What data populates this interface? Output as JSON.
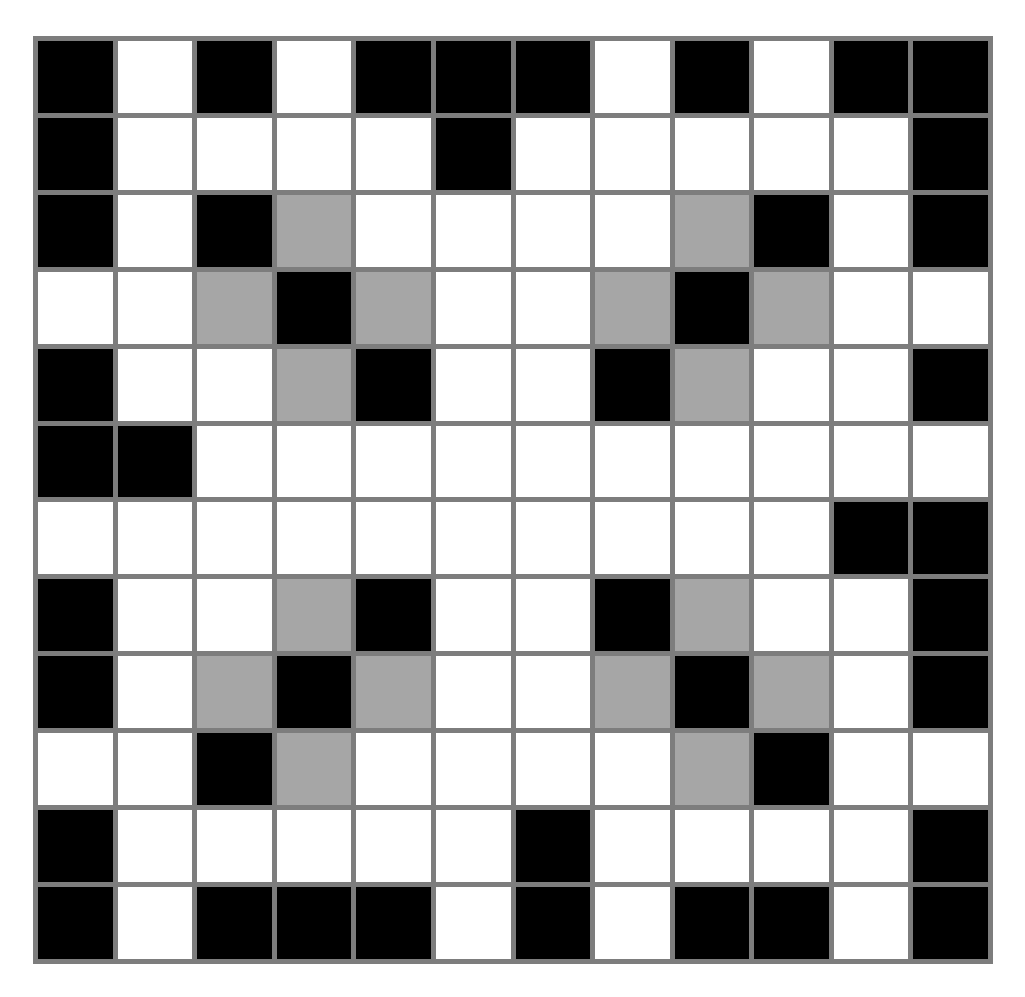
{
  "puzzle": {
    "rows": 12,
    "cols": 12,
    "legend": {
      "B": "black",
      "W": "white",
      "G": "gray"
    },
    "colors": {
      "black": "#000000",
      "white": "#ffffff",
      "gray": "#a6a6a6",
      "grid_line": "#7d7d7d"
    },
    "grid": [
      [
        "B",
        "W",
        "B",
        "W",
        "B",
        "B",
        "B",
        "W",
        "B",
        "W",
        "B",
        "B"
      ],
      [
        "B",
        "W",
        "W",
        "W",
        "W",
        "B",
        "W",
        "W",
        "W",
        "W",
        "W",
        "B"
      ],
      [
        "B",
        "W",
        "B",
        "G",
        "W",
        "W",
        "W",
        "W",
        "G",
        "B",
        "W",
        "B"
      ],
      [
        "W",
        "W",
        "G",
        "B",
        "G",
        "W",
        "W",
        "G",
        "B",
        "G",
        "W",
        "W"
      ],
      [
        "B",
        "W",
        "W",
        "G",
        "B",
        "W",
        "W",
        "B",
        "G",
        "W",
        "W",
        "B"
      ],
      [
        "B",
        "B",
        "W",
        "W",
        "W",
        "W",
        "W",
        "W",
        "W",
        "W",
        "W",
        "W"
      ],
      [
        "W",
        "W",
        "W",
        "W",
        "W",
        "W",
        "W",
        "W",
        "W",
        "W",
        "B",
        "B"
      ],
      [
        "B",
        "W",
        "W",
        "G",
        "B",
        "W",
        "W",
        "B",
        "G",
        "W",
        "W",
        "B"
      ],
      [
        "B",
        "W",
        "G",
        "B",
        "G",
        "W",
        "W",
        "G",
        "B",
        "G",
        "W",
        "B"
      ],
      [
        "W",
        "W",
        "B",
        "G",
        "W",
        "W",
        "W",
        "W",
        "G",
        "B",
        "W",
        "W"
      ],
      [
        "B",
        "W",
        "W",
        "W",
        "W",
        "W",
        "B",
        "W",
        "W",
        "W",
        "W",
        "B"
      ],
      [
        "B",
        "W",
        "B",
        "B",
        "B",
        "W",
        "B",
        "W",
        "B",
        "B",
        "W",
        "B"
      ]
    ]
  }
}
